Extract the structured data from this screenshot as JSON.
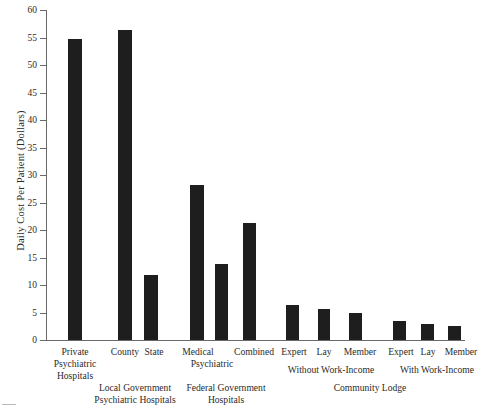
{
  "chart_data": {
    "type": "bar",
    "title": "",
    "xlabel": "",
    "ylabel": "Daily Cost Per Patient (Dollars)",
    "ylim": [
      0,
      60
    ],
    "yticks": [
      0,
      5,
      10,
      15,
      20,
      25,
      30,
      35,
      40,
      45,
      50,
      55,
      60
    ],
    "grid": false,
    "legend": "none",
    "bar_color": "#1e1e1e",
    "axis_color": "#6a6a6a",
    "background_color": "#ffffff",
    "categories": [
      "Private Psychiatric Hospitals",
      "County",
      "State",
      "Medical",
      "Psychiatric",
      "Combined",
      "Expert",
      "Lay",
      "Member",
      "Expert",
      "Lay",
      "Member"
    ],
    "values": [
      54.7,
      56.3,
      11.9,
      28.1,
      13.8,
      21.2,
      6.4,
      5.6,
      4.9,
      3.5,
      3.0,
      2.5
    ],
    "groups": [
      {
        "label": "Private Psychiatric Hospitals",
        "members": [
          "Private Psychiatric Hospitals"
        ]
      },
      {
        "label": "Local Government Psychiatric Hospitals",
        "members": [
          "County",
          "State"
        ]
      },
      {
        "label": "Federal Government Hospitals",
        "members": [
          "Medical Psychiatric",
          "Combined"
        ]
      },
      {
        "label": "Community Lodge",
        "members": [
          "Without Work-Income",
          "With Work-Income"
        ]
      }
    ]
  },
  "yaxis": {
    "title": "Daily Cost Per Patient (Dollars)",
    "ticks": [
      "60",
      "55",
      "50",
      "45",
      "40",
      "35",
      "30",
      "25",
      "20",
      "15",
      "10",
      "5",
      "0"
    ]
  },
  "bars": [
    {
      "name": "private-psychiatric-hospitals",
      "value": 54.7
    },
    {
      "name": "county",
      "value": 56.3
    },
    {
      "name": "state",
      "value": 11.9
    },
    {
      "name": "medical",
      "value": 28.1
    },
    {
      "name": "psychiatric",
      "value": 13.8
    },
    {
      "name": "combined",
      "value": 21.2
    },
    {
      "name": "expert-without-work-income",
      "value": 6.4
    },
    {
      "name": "lay-without-work-income",
      "value": 5.6
    },
    {
      "name": "member-without-work-income",
      "value": 4.9
    },
    {
      "name": "expert-with-work-income",
      "value": 3.5
    },
    {
      "name": "lay-with-work-income",
      "value": 3.0
    },
    {
      "name": "member-with-work-income",
      "value": 2.5
    }
  ],
  "labels": {
    "private_line1": "Private",
    "private_line2": "Psychiatric",
    "private_line3": "Hospitals",
    "county": "County",
    "state": "State",
    "medical": "Medical",
    "medical_line2": "Psychiatric",
    "combined": "Combined",
    "expert_a": "Expert",
    "lay_a": "Lay",
    "member_a": "Member",
    "expert_b": "Expert",
    "lay_b": "Lay",
    "member_b": "Member",
    "local_government_line1": "Local Government",
    "local_government_line2": "Psychiatric Hospitals",
    "federal_government_line1": "Federal Government",
    "federal_government_line2": "Hospitals",
    "without_work_income": "Without Work-Income",
    "with_work_income": "With Work-Income",
    "community_lodge": "Community Lodge"
  }
}
